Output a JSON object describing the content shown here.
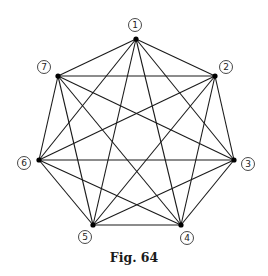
{
  "diagram": {
    "type": "complete-graph",
    "name": "K7",
    "caption": "Fig. 64",
    "colors": {
      "edge": "#1a1a1a",
      "node": "#000000",
      "label_ring": "#333333",
      "background": "#ffffff"
    },
    "nodes": [
      {
        "id": "1",
        "label": "1",
        "x": 136,
        "y": 39,
        "lx": 135,
        "ly": 25
      },
      {
        "id": "2",
        "label": "2",
        "x": 215,
        "y": 76,
        "lx": 226,
        "ly": 67
      },
      {
        "id": "3",
        "label": "3",
        "x": 234,
        "y": 160,
        "lx": 248,
        "ly": 164
      },
      {
        "id": "4",
        "label": "4",
        "x": 181,
        "y": 225,
        "lx": 187,
        "ly": 238
      },
      {
        "id": "5",
        "label": "5",
        "x": 93,
        "y": 225,
        "lx": 85,
        "ly": 237
      },
      {
        "id": "6",
        "label": "6",
        "x": 39,
        "y": 160,
        "lx": 24,
        "ly": 163
      },
      {
        "id": "7",
        "label": "7",
        "x": 58,
        "y": 76,
        "lx": 44,
        "ly": 67
      }
    ],
    "edges": [
      [
        "1",
        "2"
      ],
      [
        "1",
        "3"
      ],
      [
        "1",
        "4"
      ],
      [
        "1",
        "5"
      ],
      [
        "1",
        "6"
      ],
      [
        "1",
        "7"
      ],
      [
        "2",
        "3"
      ],
      [
        "2",
        "4"
      ],
      [
        "2",
        "5"
      ],
      [
        "2",
        "6"
      ],
      [
        "2",
        "7"
      ],
      [
        "3",
        "4"
      ],
      [
        "3",
        "5"
      ],
      [
        "3",
        "6"
      ],
      [
        "3",
        "7"
      ],
      [
        "4",
        "5"
      ],
      [
        "4",
        "6"
      ],
      [
        "4",
        "7"
      ],
      [
        "5",
        "6"
      ],
      [
        "5",
        "7"
      ],
      [
        "6",
        "7"
      ]
    ]
  }
}
